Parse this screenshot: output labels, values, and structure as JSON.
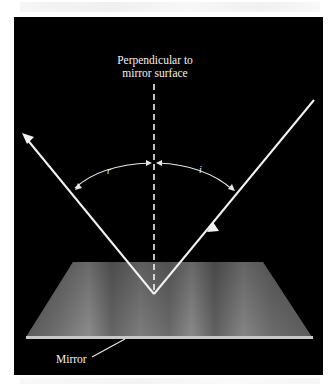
{
  "figure": {
    "normal_label_line1": "Perpendicular to",
    "normal_label_line2": "mirror surface",
    "mirror_label": "Mirror",
    "reflected_angle_label": "r",
    "incident_angle_label": "i",
    "colors": {
      "background": "#000000",
      "rays": "#f2f2f2",
      "mirror_surface": "#7a7a7a",
      "mirror_edge": "#c8c8c8",
      "page": "#ffffff"
    }
  }
}
